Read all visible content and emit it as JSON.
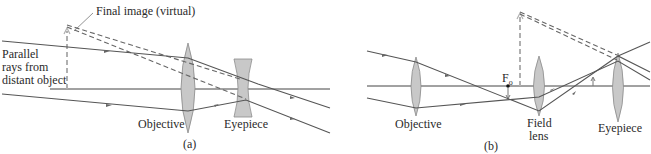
{
  "figure": {
    "panel_a": {
      "caption": "(a)",
      "labels": {
        "final_image": "Final image (virtual)",
        "parallel_rays_line1": "Parallel",
        "parallel_rays_line2": "rays from",
        "parallel_rays_line3": "distant object",
        "objective": "Objective",
        "eyepiece": "Eyepiece"
      }
    },
    "panel_b": {
      "caption": "(b)",
      "labels": {
        "focal_point": "F",
        "focal_point_sub": "o",
        "objective": "Objective",
        "field_lens_line1": "Field",
        "field_lens_line2": "lens",
        "eyepiece": "Eyepiece"
      }
    },
    "colors": {
      "ray": "#555555",
      "lens_fill": "#c8c8c8",
      "image_arrow": "#b0b0b0"
    }
  }
}
